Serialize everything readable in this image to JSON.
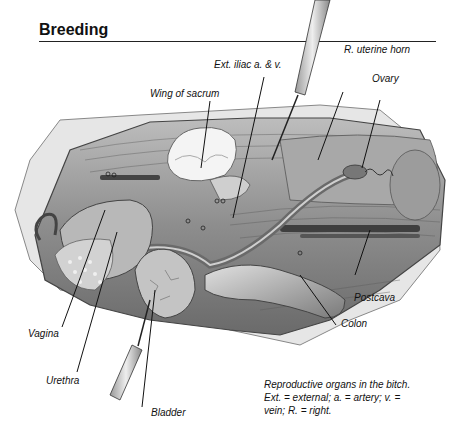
{
  "header": {
    "title": "Breeding"
  },
  "labels": {
    "ext_iliac": "Ext. iliac a. & v.",
    "r_uterine_horn": "R. uterine horn",
    "wing_of_sacrum": "Wing of sacrum",
    "ovary": "Ovary",
    "postcava": "Postcava",
    "colon": "Colon",
    "vagina": "Vagina",
    "urethra": "Urethra",
    "bladder": "Bladder"
  },
  "caption": {
    "line1": "Reproductive organs in the bitch.",
    "line2": "Ext. = external; a. = artery; v. =",
    "line3": "vein; R. = right."
  },
  "colors": {
    "ink": "#111111",
    "tissue_light": "#d8d8d8",
    "tissue_mid": "#9a9a9a",
    "tissue_dark": "#555555"
  }
}
